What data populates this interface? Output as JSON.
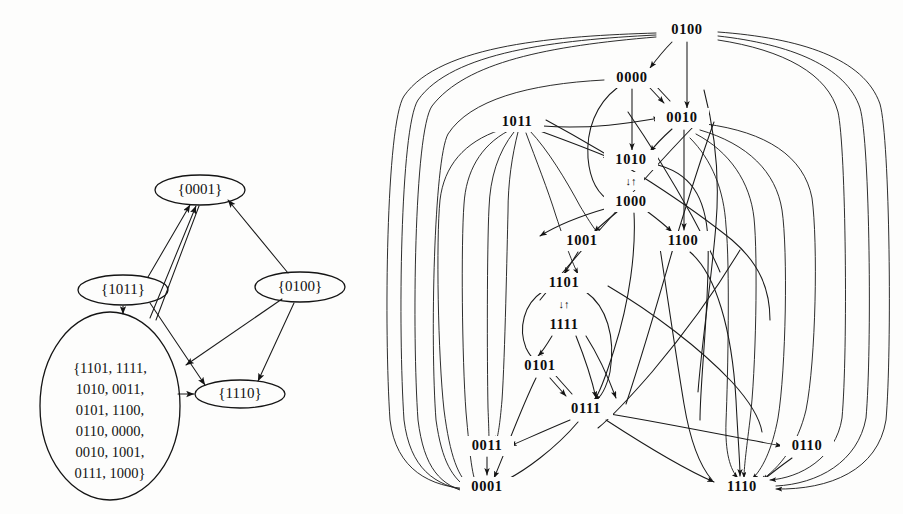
{
  "figure": {
    "title": "",
    "background_color": "#fdfdfc",
    "ink_color": "#141414"
  },
  "left_diagram": {
    "name": "quotient-graph-of-strongly-connected-components",
    "nodes": [
      {
        "id": "n0001",
        "label": "{0001}",
        "cx": 200,
        "cy": 190,
        "rx": 45,
        "ry": 15,
        "shape": "ellipse"
      },
      {
        "id": "n1011",
        "label": "{1011}",
        "cx": 123,
        "cy": 290,
        "rx": 45,
        "ry": 15,
        "shape": "ellipse"
      },
      {
        "id": "n0100",
        "label": "{0100}",
        "cx": 300,
        "cy": 287,
        "rx": 45,
        "ry": 15,
        "shape": "ellipse"
      },
      {
        "id": "n1110",
        "label": "{1110}",
        "cx": 240,
        "cy": 394,
        "rx": 45,
        "ry": 14,
        "shape": "ellipse"
      },
      {
        "id": "nbig",
        "label": "",
        "cx": 110,
        "cy": 406,
        "rx": 70,
        "ry": 94,
        "shape": "ellipse"
      }
    ],
    "big_set_lines": [
      "{1101, 1111,",
      "1010, 0011,",
      "0101, 1100,",
      "0110, 0000,",
      "0010, 1001,",
      "0111, 1000}"
    ],
    "edges": [
      {
        "from": "n1011",
        "to": "n0001"
      },
      {
        "from": "nbig",
        "to": "n0001"
      },
      {
        "from": "n0100",
        "to": "n0001"
      },
      {
        "from": "n1011",
        "to": "nbig"
      },
      {
        "from": "n1011",
        "to": "n1110"
      },
      {
        "from": "n0100",
        "to": "nbig"
      },
      {
        "from": "n0100",
        "to": "n1110"
      },
      {
        "from": "nbig",
        "to": "n1110"
      }
    ]
  },
  "right_diagram": {
    "name": "state-transition-graph-4bit",
    "nodes": [
      {
        "id": "0100",
        "label": "0100",
        "x": 687,
        "y": 30
      },
      {
        "id": "0000",
        "label": "0000",
        "x": 632,
        "y": 78
      },
      {
        "id": "1011",
        "label": "1011",
        "x": 517,
        "y": 122
      },
      {
        "id": "0010",
        "label": "0010",
        "x": 682,
        "y": 118
      },
      {
        "id": "1010",
        "label": "1010",
        "x": 631,
        "y": 160
      },
      {
        "id": "1000",
        "label": "1000",
        "x": 631,
        "y": 202
      },
      {
        "id": "1001",
        "label": "1001",
        "x": 582,
        "y": 241
      },
      {
        "id": "1100",
        "label": "1100",
        "x": 683,
        "y": 241
      },
      {
        "id": "1101",
        "label": "1101",
        "x": 564,
        "y": 283
      },
      {
        "id": "1111",
        "label": "1111",
        "x": 564,
        "y": 325
      },
      {
        "id": "0101",
        "label": "0101",
        "x": 540,
        "y": 366
      },
      {
        "id": "0111",
        "label": "0111",
        "x": 586,
        "y": 409
      },
      {
        "id": "0011",
        "label": "0011",
        "x": 487,
        "y": 446
      },
      {
        "id": "0001",
        "label": "0001",
        "x": 487,
        "y": 487
      },
      {
        "id": "0110",
        "label": "0110",
        "x": 807,
        "y": 446
      },
      {
        "id": "1110",
        "label": "1110",
        "x": 742,
        "y": 487
      }
    ],
    "pair_markers": [
      {
        "between": [
          "1010",
          "1000"
        ],
        "label": "↓↑",
        "x": 631,
        "y": 181
      },
      {
        "between": [
          "1101",
          "1111"
        ],
        "label": "↓↑",
        "x": 564,
        "y": 304
      }
    ],
    "edges": [
      {
        "from": "0100",
        "to": "0000"
      },
      {
        "from": "0100",
        "to": "0010"
      },
      {
        "from": "0100",
        "to": "1110"
      },
      {
        "from": "0100",
        "to": "0001"
      },
      {
        "from": "0100",
        "to": "0110"
      },
      {
        "from": "0000",
        "to": "1010"
      },
      {
        "from": "0000",
        "to": "0010"
      },
      {
        "from": "0000",
        "to": "1000"
      },
      {
        "from": "0010",
        "to": "1010"
      },
      {
        "from": "0010",
        "to": "1100"
      },
      {
        "from": "0010",
        "to": "1110"
      },
      {
        "from": "1011",
        "to": "0010"
      },
      {
        "from": "1011",
        "to": "1010"
      },
      {
        "from": "1011",
        "to": "1001"
      },
      {
        "from": "1011",
        "to": "0001"
      },
      {
        "from": "1011",
        "to": "1110"
      },
      {
        "from": "1010",
        "to": "1000"
      },
      {
        "from": "1000",
        "to": "1010"
      },
      {
        "from": "1000",
        "to": "1001"
      },
      {
        "from": "1000",
        "to": "1100"
      },
      {
        "from": "1000",
        "to": "0111"
      },
      {
        "from": "1001",
        "to": "1101"
      },
      {
        "from": "1100",
        "to": "1110"
      },
      {
        "from": "1101",
        "to": "1111"
      },
      {
        "from": "1111",
        "to": "1101"
      },
      {
        "from": "1111",
        "to": "0101"
      },
      {
        "from": "1111",
        "to": "0111"
      },
      {
        "from": "1101",
        "to": "0101"
      },
      {
        "from": "1101",
        "to": "0111"
      },
      {
        "from": "0101",
        "to": "0111"
      },
      {
        "from": "0111",
        "to": "0101"
      },
      {
        "from": "0101",
        "to": "0001"
      },
      {
        "from": "0111",
        "to": "0011"
      },
      {
        "from": "0111",
        "to": "0001"
      },
      {
        "from": "0111",
        "to": "0110"
      },
      {
        "from": "0111",
        "to": "1110"
      },
      {
        "from": "0011",
        "to": "0001"
      },
      {
        "from": "0110",
        "to": "1110"
      },
      {
        "from": "1010",
        "to": "1110"
      }
    ]
  }
}
